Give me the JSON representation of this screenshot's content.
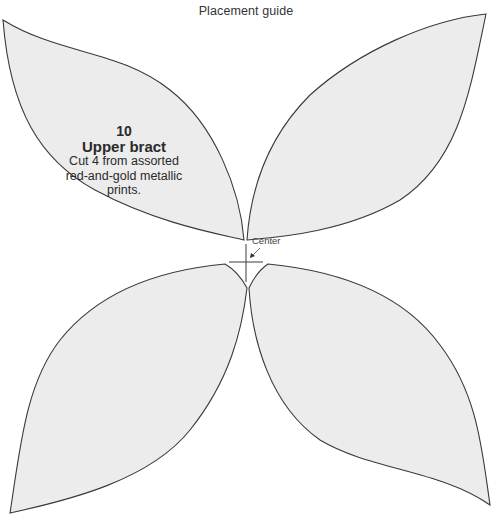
{
  "title": "Placement guide",
  "piece": {
    "number": "10",
    "name": "Upper bract",
    "instructions": "Cut 4 from assorted red-and-gold metallic prints."
  },
  "center_marker": {
    "label": "Center"
  },
  "colors": {
    "background": "#ffffff",
    "petal_fill": "#ececec",
    "outline": "#3a3a3a"
  },
  "petal_count": 4
}
